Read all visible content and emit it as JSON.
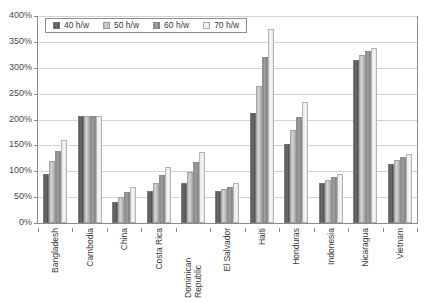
{
  "chart_data": {
    "type": "bar",
    "title": "",
    "xlabel": "",
    "ylabel": "",
    "ylim": [
      0,
      400
    ],
    "ytick_step": 50,
    "grid": true,
    "legend_position": "top-left inside plot",
    "ytick_labels": [
      "400%",
      "350%",
      "300%",
      "250%",
      "200%",
      "150%",
      "100%",
      "50%",
      "0%"
    ],
    "categories": [
      "Bangladesh",
      "Cambodia",
      "China",
      "Costa Rica",
      "Dominican Republic",
      "El Salvador",
      "Haiti",
      "Honduras",
      "Indonesia",
      "Nicaragua",
      "Vietnam"
    ],
    "series": [
      {
        "name": "40 h/w",
        "color": "#5a5a5a",
        "values": [
          95,
          207,
          40,
          62,
          78,
          62,
          213,
          153,
          78,
          315,
          115
        ]
      },
      {
        "name": "50 h/w",
        "color": "#c9c9c9",
        "values": [
          120,
          207,
          50,
          78,
          98,
          65,
          265,
          180,
          83,
          325,
          122
        ]
      },
      {
        "name": "60 h/w",
        "color": "#8f8f8f",
        "values": [
          140,
          207,
          60,
          93,
          117,
          70,
          320,
          205,
          88,
          333,
          128
        ]
      },
      {
        "name": "70 h/w",
        "color": "#f0f0f0",
        "values": [
          160,
          207,
          70,
          108,
          137,
          78,
          375,
          233,
          95,
          338,
          133
        ]
      }
    ]
  }
}
